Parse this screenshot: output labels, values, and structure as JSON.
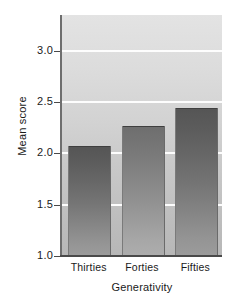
{
  "chart_data": {
    "type": "bar",
    "title": "",
    "subtitle": "",
    "xlabel": "Generativity",
    "ylabel": "Mean score",
    "categories": [
      "Thirties",
      "Forties",
      "Fifties"
    ],
    "values": [
      2.07,
      2.27,
      2.44
    ],
    "ylim": [
      1.0,
      3.35
    ],
    "yticks": [
      1.0,
      1.5,
      2.0,
      2.5,
      3.0
    ],
    "ytick_labels": [
      "1.0",
      "1.5",
      "2.0",
      "2.5",
      "3.0"
    ],
    "gridlines": [
      1.5,
      2.0,
      2.5,
      3.0
    ],
    "grid": true,
    "legend": null,
    "legend_position": "none",
    "annotations": [],
    "colors": {
      "bar_top": "#555555",
      "bar_bottom": "#9c9c9c",
      "plot_background_top": "#e3e3e3",
      "plot_background_bottom": "#b7b7b7",
      "gridline": "#fdfdfd",
      "axis": "#4a4a4a",
      "text": "#1a1a1a",
      "figure_background": "#ffffff"
    }
  }
}
